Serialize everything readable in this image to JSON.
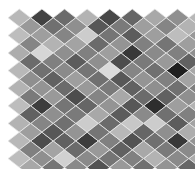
{
  "figure": {
    "title": "",
    "background_color": "#ffffff",
    "width": 195,
    "height": 169
  },
  "corner_mark": {
    "name": "corner-artifact",
    "visible": true
  },
  "chart_data": {
    "type": "heatmap",
    "title": "",
    "subtitle": "",
    "xlabel": "",
    "ylabel": "",
    "grid": false,
    "legend": null,
    "xticklabels": [],
    "yticklabels": [],
    "cell_geometry": {
      "shape": "rhombus",
      "cell_width": 22.6,
      "cell_height": 17.6,
      "row_offset_x": 11.3,
      "origin_x": 8,
      "origin_y": 9,
      "stroke_color": "#e8e8e8",
      "stroke_width": 0.8
    },
    "value_range": [
      0,
      1
    ],
    "colormap": "gray",
    "rows": 9,
    "cols": 9,
    "values": [
      [
        0.72,
        0.26,
        0.42,
        0.7,
        0.28,
        0.4,
        0.66,
        0.56,
        0.72
      ],
      [
        0.74,
        0.62,
        0.52,
        0.8,
        0.46,
        0.36,
        0.62,
        0.74,
        0.6
      ],
      [
        0.68,
        0.84,
        0.56,
        0.5,
        0.62,
        0.22,
        0.54,
        0.5,
        0.56
      ],
      [
        0.72,
        0.44,
        0.54,
        0.46,
        0.86,
        0.52,
        0.44,
        0.12,
        0.66
      ],
      [
        0.7,
        0.58,
        0.42,
        0.6,
        0.48,
        0.38,
        0.56,
        0.44,
        0.5
      ],
      [
        0.74,
        0.24,
        0.46,
        0.4,
        0.58,
        0.34,
        0.18,
        0.62,
        0.7
      ],
      [
        0.7,
        0.52,
        0.44,
        0.8,
        0.42,
        0.78,
        0.8,
        0.36,
        0.64
      ],
      [
        0.72,
        0.3,
        0.38,
        0.24,
        0.5,
        0.32,
        0.44,
        0.22,
        0.58
      ],
      [
        0.74,
        0.56,
        0.82,
        0.54,
        0.46,
        0.5,
        0.7,
        0.54,
        0.68
      ]
    ],
    "values_offset_row": [
      [
        0.6,
        0.44,
        0.56,
        0.34,
        0.48,
        0.62,
        0.52,
        0.7,
        0.66
      ],
      [
        0.52,
        0.7,
        0.64,
        0.42,
        0.58,
        0.5,
        0.46,
        0.62,
        0.74
      ],
      [
        0.42,
        0.5,
        0.36,
        0.56,
        0.3,
        0.48,
        0.6,
        0.38,
        0.54
      ],
      [
        0.56,
        0.38,
        0.62,
        0.44,
        0.34,
        0.58,
        0.5,
        0.64,
        0.46
      ],
      [
        0.48,
        0.6,
        0.3,
        0.52,
        0.66,
        0.42,
        0.38,
        0.56,
        0.62
      ],
      [
        0.38,
        0.56,
        0.48,
        0.66,
        0.36,
        0.54,
        0.44,
        0.5,
        0.58
      ],
      [
        0.62,
        0.34,
        0.58,
        0.46,
        0.72,
        0.4,
        0.56,
        0.68,
        0.44
      ],
      [
        0.5,
        0.64,
        0.42,
        0.6,
        0.38,
        0.66,
        0.48,
        0.54,
        0.7
      ],
      [
        0.66,
        0.46,
        0.54,
        0.32,
        0.6,
        0.44,
        0.58,
        0.4,
        0.62
      ]
    ]
  }
}
